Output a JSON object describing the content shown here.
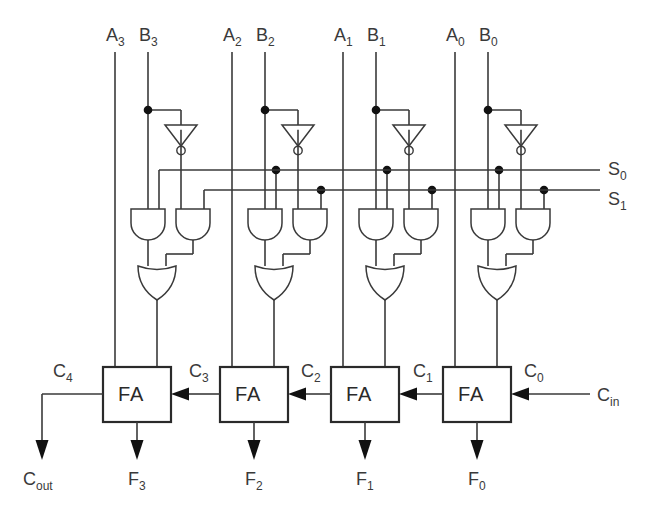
{
  "diagram": {
    "type": "logic-circuit-schematic"
  },
  "colors": {
    "wire": "#3a3a3a",
    "text": "#3a3a3a",
    "box_stroke": "#2a2a2a",
    "junction": "#111111",
    "background": "#ffffff"
  },
  "inputs": {
    "operands": [
      {
        "a": "A",
        "a_sub": "3",
        "b": "B",
        "b_sub": "3"
      },
      {
        "a": "A",
        "a_sub": "2",
        "b": "B",
        "b_sub": "2"
      },
      {
        "a": "A",
        "a_sub": "1",
        "b": "B",
        "b_sub": "1"
      },
      {
        "a": "A",
        "a_sub": "0",
        "b": "B",
        "b_sub": "0"
      }
    ],
    "carry_in": {
      "text": "C",
      "sub": "in"
    }
  },
  "select_bus": [
    {
      "text": "S",
      "sub": "0"
    },
    {
      "text": "S",
      "sub": "1"
    }
  ],
  "adders": {
    "label": "FA",
    "cells": [
      "FA",
      "FA",
      "FA",
      "FA"
    ]
  },
  "carries": [
    {
      "text": "C",
      "sub": "4"
    },
    {
      "text": "C",
      "sub": "3"
    },
    {
      "text": "C",
      "sub": "2"
    },
    {
      "text": "C",
      "sub": "1"
    },
    {
      "text": "C",
      "sub": "0"
    }
  ],
  "outputs": {
    "carry_out": {
      "text": "C",
      "sub": "out"
    },
    "sums": [
      {
        "text": "F",
        "sub": "3"
      },
      {
        "text": "F",
        "sub": "2"
      },
      {
        "text": "F",
        "sub": "1"
      },
      {
        "text": "F",
        "sub": "0"
      }
    ]
  },
  "gates": {
    "inverter": "not-gate",
    "and": "and-gate",
    "or": "or-gate",
    "full_adder": "full-adder-box"
  }
}
